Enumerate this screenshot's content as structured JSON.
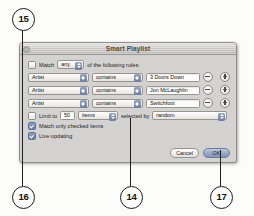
{
  "figure": {
    "callouts": [
      {
        "number": "15"
      },
      {
        "number": "16"
      },
      {
        "number": "14"
      },
      {
        "number": "17"
      }
    ]
  },
  "dialog": {
    "title": "Smart Playlist",
    "match": {
      "label_before": "Match",
      "selected": "any",
      "label_after": "of the following rules:"
    },
    "rules": [
      {
        "field": "Artist",
        "operator": "contains",
        "value": "3 Doors Down",
        "remove_label": "−",
        "add_label": "+"
      },
      {
        "field": "Artist",
        "operator": "contains",
        "value": "Jon McLaughlin",
        "remove_label": "−",
        "add_label": "+"
      },
      {
        "field": "Artist",
        "operator": "contains",
        "value": "Switchfoot",
        "remove_label": "−",
        "add_label": "+"
      }
    ],
    "limit": {
      "checkbox_checked": false,
      "label": "Limit to",
      "number": "50",
      "unit": "items",
      "selected_by_label": "selected by",
      "selected_by": "random"
    },
    "options": [
      {
        "label": "Match only checked items",
        "checked": true
      },
      {
        "label": "Live updating",
        "checked": true
      }
    ],
    "buttons": {
      "cancel": "Cancel",
      "ok": "OK"
    }
  }
}
